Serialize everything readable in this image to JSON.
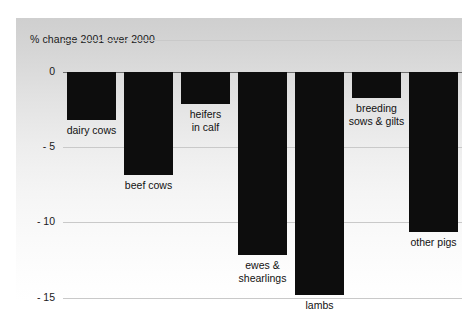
{
  "chart_data": {
    "type": "bar",
    "title": "% change 2001 over 2000",
    "xlabel": "",
    "ylabel": "",
    "ylim": [
      -15.8,
      0.9
    ],
    "yticks": [
      0,
      -5,
      -10,
      -15
    ],
    "ytick_labels": [
      "0",
      "- 5",
      "- 10",
      "- 15"
    ],
    "grid": true,
    "legend": "none",
    "orientation": "vertical",
    "bar_color": "#0d0d0d",
    "categories": [
      "dairy cows",
      "beef cows",
      "heifers in calf",
      "ewes & shearlings",
      "lambs",
      "breeding sows & gilts",
      "other pigs"
    ],
    "category_labels": [
      "dairy cows",
      "beef cows",
      "heifers\nin calf",
      "ewes &\nshearlings",
      "lambs",
      "breeding\nsows & gilts",
      "other pigs"
    ],
    "values": [
      -3.2,
      -6.8,
      -2.1,
      -12.1,
      -14.8,
      -1.7,
      -10.6
    ]
  }
}
